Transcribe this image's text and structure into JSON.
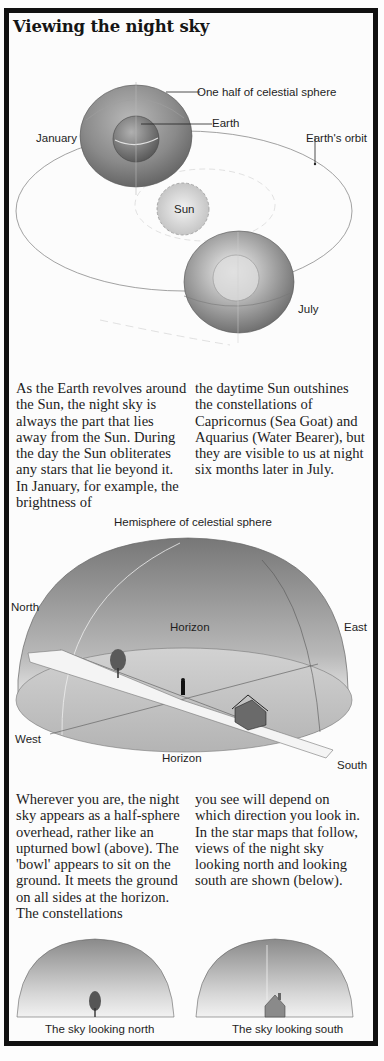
{
  "title": "Viewing the night sky",
  "diagram1": {
    "labels": {
      "celestial_half": "One half of celestial sphere",
      "earth": "Earth",
      "january": "January",
      "earths_orbit": "Earth's orbit",
      "sun": "Sun",
      "july": "July"
    }
  },
  "paragraph1": {
    "col1": "As the Earth revolves around the Sun, the night sky is always the part that lies away from the Sun. During the day the Sun obliterates any stars that lie beyond it. In January, for example, the brightness of",
    "col2": "the daytime Sun outshines the constellations of Capricornus (Sea Goat) and Aquarius (Water Bearer), but they are visible to us at night six months later in July."
  },
  "diagram2": {
    "labels": {
      "hemisphere": "Hemisphere of celestial sphere",
      "north": "North",
      "east": "East",
      "horizon_top": "Horizon",
      "west": "West",
      "horizon_bottom": "Horizon",
      "south": "South"
    }
  },
  "paragraph2": {
    "col1": "Wherever you are, the night sky appears as a half-sphere overhead, rather like an upturned bowl (above). The 'bowl' appears to sit on the ground. It meets the ground on all sides at the horizon. The constellations",
    "col2": "you see will depend on which direction you look in. In the star maps that follow, views of the night sky looking north and looking south are shown (below)."
  },
  "sky_views": {
    "north_caption": "The sky looking north",
    "south_caption": "The sky looking south"
  },
  "colors": {
    "border": "#111111",
    "text": "#1c1c1c",
    "sphere_dark": "#6a6a6a",
    "sphere_light": "#e6e6e6"
  }
}
